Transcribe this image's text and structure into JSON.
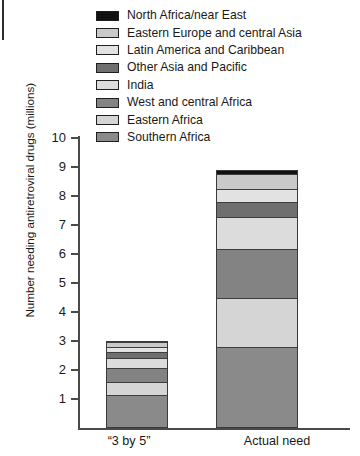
{
  "chart_data": {
    "type": "bar",
    "stacked": true,
    "title": "",
    "subtitle": "",
    "xlabel": "",
    "ylabel": "Number needing antiretroviral drugs (millions)",
    "ylim": [
      0,
      10
    ],
    "ytick_labels": [
      "10",
      "9",
      "8",
      "7",
      "6",
      "5",
      "4",
      "3",
      "2",
      "1"
    ],
    "ytick_values": [
      10,
      9,
      8,
      7,
      6,
      5,
      4,
      3,
      2,
      1
    ],
    "grid": false,
    "legend_position": "top",
    "categories": [
      "“3 by 5”",
      "Actual need"
    ],
    "series": [
      {
        "name": "North Africa/near East",
        "color": "#111111",
        "values": [
          0.05,
          0.15
        ]
      },
      {
        "name": "Eastern Europe and central Asia",
        "color": "#c9c9c9",
        "values": [
          0.15,
          0.5
        ]
      },
      {
        "name": "Latin America and Caribbean",
        "color": "#e2e2e2",
        "values": [
          0.2,
          0.45
        ]
      },
      {
        "name": "Other Asia and Pacific",
        "color": "#6f6f6f",
        "values": [
          0.2,
          0.55
        ]
      },
      {
        "name": "India",
        "color": "#dcdcdc",
        "values": [
          0.35,
          1.1
        ]
      },
      {
        "name": "West and central Africa",
        "color": "#838383",
        "values": [
          0.5,
          1.7
        ]
      },
      {
        "name": "Eastern Africa",
        "color": "#d5d5d5",
        "values": [
          0.45,
          1.7
        ]
      },
      {
        "name": "Southern Africa",
        "color": "#8a8a8a",
        "values": [
          1.1,
          2.75
        ]
      }
    ],
    "totals": [
      3.0,
      8.9
    ]
  },
  "legend": {
    "items": [
      {
        "label": "North Africa/near East"
      },
      {
        "label": "Eastern Europe and central Asia"
      },
      {
        "label": "Latin America and Caribbean"
      },
      {
        "label": "Other Asia and Pacific"
      },
      {
        "label": "India"
      },
      {
        "label": "West and central Africa"
      },
      {
        "label": "Eastern Africa"
      },
      {
        "label": "Southern Africa"
      }
    ]
  },
  "axes": {
    "y_title": "Number needing antiretroviral drugs (millions)",
    "y_ticks": [
      "10",
      "9",
      "8",
      "7",
      "6",
      "5",
      "4",
      "3",
      "2",
      "1"
    ],
    "x_categories": [
      "“3 by 5”",
      "Actual need"
    ]
  }
}
